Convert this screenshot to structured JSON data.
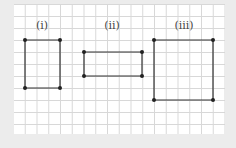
{
  "diagram": {
    "shapes": [
      {
        "label": "(i)",
        "label_pos": [
          42,
          27
        ],
        "corners": [
          [
            25,
            40
          ],
          [
            60,
            40
          ],
          [
            60,
            88
          ],
          [
            25,
            88
          ]
        ]
      },
      {
        "label": "(ii)",
        "label_pos": [
          112,
          27
        ],
        "corners": [
          [
            84,
            52
          ],
          [
            142,
            52
          ],
          [
            142,
            76
          ],
          [
            84,
            76
          ]
        ]
      },
      {
        "label": "(iii)",
        "label_pos": [
          184,
          27
        ],
        "corners": [
          [
            154,
            40
          ],
          [
            213,
            40
          ],
          [
            213,
            100
          ],
          [
            154,
            100
          ]
        ]
      }
    ],
    "colors": {
      "line": "#333333",
      "dot": "#222222",
      "grid": "#d8d8d8",
      "paper": "#ffffff",
      "background": "#ececec"
    }
  }
}
